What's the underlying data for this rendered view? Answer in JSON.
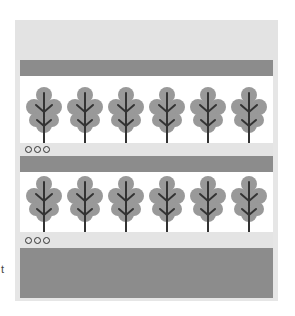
{
  "panel": {
    "colors": {
      "frame": "#e6e6e6",
      "dark_band": "#8c8c8c",
      "leaf": "#999999",
      "stem": "#333333",
      "white": "#ffffff"
    },
    "rows": [
      {
        "leaves": [
          "oak-leaf-icon",
          "oak-leaf-icon",
          "oak-leaf-icon",
          "oak-leaf-icon",
          "oak-leaf-icon",
          "oak-leaf-icon"
        ],
        "dots": 3
      },
      {
        "leaves": [
          "oak-leaf-icon",
          "oak-leaf-icon",
          "oak-leaf-icon",
          "oak-leaf-icon",
          "oak-leaf-icon",
          "oak-leaf-icon"
        ],
        "dots": 3
      }
    ]
  },
  "side_text": "t"
}
